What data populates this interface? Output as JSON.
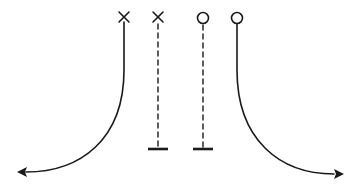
{
  "diagram": {
    "type": "play-diagram",
    "colors": {
      "stroke": "#1a1a1a",
      "background": "#ffffff"
    },
    "players": [
      {
        "id": "x1",
        "symbol": "X",
        "x": 124,
        "y": 18,
        "route": "curve-left-arrow",
        "line": "solid"
      },
      {
        "id": "x2",
        "symbol": "X",
        "x": 158,
        "y": 18,
        "route": "straight-down-block",
        "line": "dashed"
      },
      {
        "id": "o1",
        "symbol": "O",
        "x": 203,
        "y": 18,
        "route": "straight-down-block",
        "line": "dashed"
      },
      {
        "id": "o2",
        "symbol": "O",
        "x": 237,
        "y": 18,
        "route": "curve-right-arrow",
        "line": "solid"
      }
    ],
    "endpoints": [
      {
        "type": "arrow",
        "direction": "left",
        "x": 18,
        "y": 172
      },
      {
        "type": "block-bar",
        "x": 158,
        "y": 149
      },
      {
        "type": "block-bar",
        "x": 203,
        "y": 149
      },
      {
        "type": "arrow",
        "direction": "right",
        "x": 343,
        "y": 174
      }
    ]
  }
}
